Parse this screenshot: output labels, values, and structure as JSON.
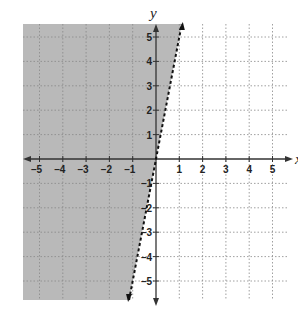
{
  "chart_data": {
    "type": "line",
    "title": "",
    "xlabel": "x",
    "ylabel": "y",
    "xlim": [
      -5,
      5
    ],
    "ylim": [
      -5,
      5
    ],
    "grid": true,
    "grid_style": "dotted",
    "x_ticks": [
      "-5",
      "-4",
      "-3",
      "-2",
      "-1",
      "1",
      "2",
      "3",
      "4",
      "5"
    ],
    "y_ticks": [
      "5",
      "4",
      "3",
      "2",
      "1",
      "-1",
      "-2",
      "-3",
      "-4",
      "-5"
    ],
    "boundary_line": {
      "equation": "y = 5x",
      "style": "dashed",
      "points": [
        [
          -1.1,
          -5.5
        ],
        [
          0,
          0
        ],
        [
          1,
          5
        ],
        [
          1.1,
          5.5
        ]
      ]
    },
    "shaded_region": {
      "inequality": "y > 5x",
      "side": "left",
      "color": "#b9b9b9"
    }
  }
}
